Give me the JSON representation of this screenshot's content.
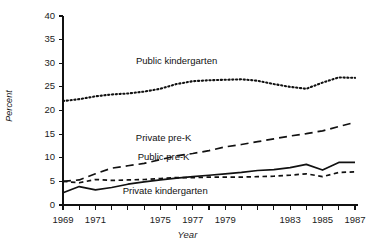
{
  "figure": {
    "faint_header": "",
    "background": "#ffffff",
    "ink": "#111111"
  },
  "chart_data": {
    "type": "line",
    "title": "",
    "xlabel": "Year",
    "ylabel": "Percent",
    "xlim": [
      1969,
      1987
    ],
    "ylim": [
      0,
      40
    ],
    "grid": false,
    "legend_position": "inline-annotations",
    "x": [
      1969,
      1970,
      1971,
      1972,
      1973,
      1974,
      1975,
      1976,
      1977,
      1978,
      1979,
      1980,
      1981,
      1982,
      1983,
      1984,
      1985,
      1986,
      1987
    ],
    "xtick_labels": [
      "1969",
      "1971",
      "1975",
      "1977",
      "1979",
      "1983",
      "1985",
      "1987"
    ],
    "xtick_values": [
      1969,
      1971,
      1975,
      1977,
      1979,
      1983,
      1985,
      1987
    ],
    "ytick_values": [
      0,
      5,
      10,
      15,
      20,
      25,
      30,
      35,
      40
    ],
    "ytick_labels": [
      "0",
      "5",
      "10",
      "15",
      "20",
      "25",
      "30",
      "35",
      "40"
    ],
    "series": [
      {
        "name": "Public kindergarten",
        "style": "dotted",
        "label_x": 1976.0,
        "label_y": 30.5,
        "values": [
          22.0,
          22.4,
          23.0,
          23.4,
          23.6,
          24.0,
          24.6,
          25.6,
          26.2,
          26.4,
          26.5,
          26.6,
          26.3,
          25.6,
          25.0,
          24.6,
          25.9,
          27.0,
          26.9
        ]
      },
      {
        "name": "Private pre-K",
        "style": "dashed-long",
        "label_x": 1975.2,
        "label_y": 14.1,
        "values": [
          5.0,
          5.3,
          6.6,
          7.8,
          8.3,
          8.8,
          9.6,
          10.4,
          10.9,
          11.5,
          12.3,
          12.8,
          13.4,
          14.0,
          14.6,
          15.1,
          15.7,
          16.6,
          17.5
        ]
      },
      {
        "name": "Public pre-K",
        "style": "solid",
        "label_x": 1975.2,
        "label_y": 10.2,
        "values": [
          2.6,
          3.9,
          3.2,
          3.7,
          4.4,
          4.9,
          5.3,
          5.7,
          6.0,
          6.3,
          6.6,
          6.9,
          7.3,
          7.5,
          7.9,
          8.6,
          7.4,
          9.0,
          9.0
        ]
      },
      {
        "name": "Private kindergarten",
        "style": "dashed-short",
        "label_x": 1975.3,
        "label_y": 3.0,
        "values": [
          5.0,
          4.7,
          5.4,
          5.2,
          5.3,
          5.4,
          5.6,
          5.8,
          5.8,
          5.9,
          5.9,
          5.9,
          6.0,
          6.1,
          6.3,
          6.6,
          6.0,
          6.9,
          7.0
        ]
      }
    ]
  }
}
